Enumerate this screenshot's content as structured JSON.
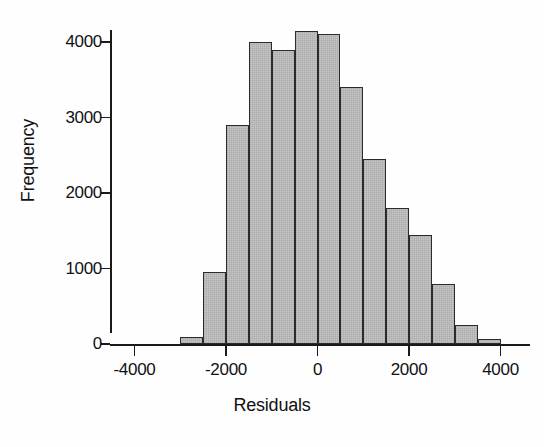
{
  "chart_data": {
    "type": "bar",
    "subtype": "histogram",
    "title": "",
    "xlabel": "Residuals",
    "ylabel": "Frequency",
    "xlim": [
      -4500,
      4500
    ],
    "ylim": [
      0,
      4300
    ],
    "bin_width": 500,
    "grid": false,
    "legend": null,
    "x_ticks": [
      -4000,
      -2000,
      0,
      2000,
      4000
    ],
    "x_tick_labels": [
      "-4000",
      "-2000",
      "0",
      "2000",
      "4000"
    ],
    "y_ticks": [
      0,
      1000,
      2000,
      3000,
      4000
    ],
    "y_tick_labels": [
      "0",
      "1000",
      "2000",
      "3000",
      "4000"
    ],
    "bin_edges": [
      -3000,
      -2500,
      -2000,
      -1500,
      -1000,
      -500,
      0,
      500,
      1000,
      1500,
      2000,
      2500,
      3000,
      3500,
      4000
    ],
    "bin_centers": [
      -2750,
      -2250,
      -1750,
      -1250,
      -750,
      -250,
      250,
      750,
      1250,
      1750,
      2250,
      2750,
      3250,
      3750
    ],
    "values": [
      90,
      950,
      2900,
      4000,
      3900,
      4150,
      4100,
      3400,
      2450,
      1800,
      1450,
      800,
      250,
      60
    ],
    "bars": [
      {
        "x0": -3000,
        "x1": -2500,
        "value": 90
      },
      {
        "x0": -2500,
        "x1": -2000,
        "value": 950
      },
      {
        "x0": -2000,
        "x1": -1500,
        "value": 2900
      },
      {
        "x0": -1500,
        "x1": -1000,
        "value": 4000
      },
      {
        "x0": -1000,
        "x1": -500,
        "value": 3900
      },
      {
        "x0": -500,
        "x1": 0,
        "value": 4150
      },
      {
        "x0": 0,
        "x1": 500,
        "value": 4100
      },
      {
        "x0": 500,
        "x1": 1000,
        "value": 3400
      },
      {
        "x0": 1000,
        "x1": 1500,
        "value": 2450
      },
      {
        "x0": 1500,
        "x1": 2000,
        "value": 1800
      },
      {
        "x0": 2000,
        "x1": 2500,
        "value": 1450
      },
      {
        "x0": 2500,
        "x1": 3000,
        "value": 800
      },
      {
        "x0": 3000,
        "x1": 3500,
        "value": 250
      },
      {
        "x0": 3500,
        "x1": 4000,
        "value": 60
      }
    ],
    "colors": {
      "bar_fill": "#c6c6c6",
      "bar_edge": "#2b2b2b",
      "axis": "#1a1a1a",
      "text": "#111111",
      "background": "#fefefe"
    }
  }
}
